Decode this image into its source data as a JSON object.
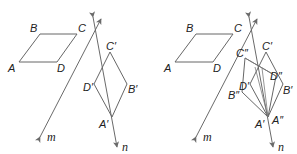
{
  "panels": [
    {
      "name": "left",
      "original": {
        "A": "A",
        "B": "B",
        "C": "C",
        "D": "D"
      },
      "image1": {
        "A": "A′",
        "B": "B′",
        "C": "C′",
        "D": "D′"
      },
      "lines": {
        "m": "m",
        "n": "n"
      }
    },
    {
      "name": "right",
      "original": {
        "A": "A",
        "B": "B",
        "C": "C",
        "D": "D"
      },
      "image1": {
        "A": "A′",
        "B": "B′",
        "C": "C′",
        "D": "D′"
      },
      "image2": {
        "A": "A″",
        "B": "B″",
        "C": "C″",
        "D": "D″"
      },
      "lines": {
        "m": "m",
        "n": "n"
      }
    }
  ],
  "colors": {
    "stroke": "#666666",
    "text": "#222222",
    "background": "#ffffff"
  }
}
